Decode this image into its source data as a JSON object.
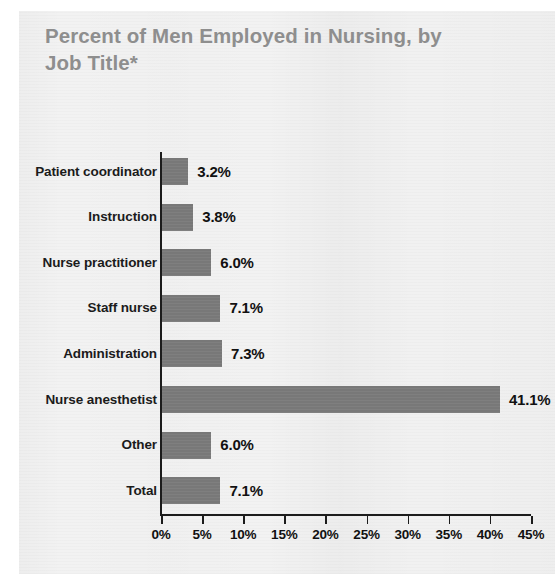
{
  "figure": {
    "title": "Percent of Men Employed in Nursing, by\nJob Title*",
    "title_color": "#8e8e8e",
    "background_color": "#f2f2f2",
    "bar_color": "#787878",
    "axis_color": "#1b1b1b"
  },
  "chart_data": {
    "type": "bar",
    "orientation": "horizontal",
    "title": "Percent of Men Employed in Nursing, by Job Title*",
    "xlabel": "",
    "ylabel": "",
    "categories": [
      "Patient coordinator",
      "Instruction",
      "Nurse practitioner",
      "Staff nurse",
      "Administration",
      "Nurse anesthetist",
      "Other",
      "Total"
    ],
    "values": [
      3.2,
      3.8,
      6.0,
      7.1,
      7.3,
      41.1,
      6.0,
      7.1
    ],
    "value_labels": [
      "3.2%",
      "3.8%",
      "6.0%",
      "7.1%",
      "7.3%",
      "41.1%",
      "6.0%",
      "7.1%"
    ],
    "xlim": [
      0,
      45
    ],
    "xticks": [
      0,
      5,
      10,
      15,
      20,
      25,
      30,
      35,
      40,
      45
    ],
    "xtick_labels": [
      "0%",
      "5%",
      "10%",
      "15%",
      "20%",
      "25%",
      "30%",
      "35%",
      "40%",
      "45%"
    ],
    "grid": false,
    "legend": null,
    "series": [
      {
        "name": "Percent of men employed",
        "values": [
          3.2,
          3.8,
          6.0,
          7.1,
          7.3,
          41.1,
          6.0,
          7.1
        ]
      }
    ]
  }
}
